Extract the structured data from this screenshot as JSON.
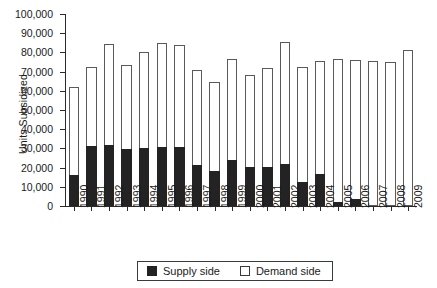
{
  "chart_data": {
    "type": "bar",
    "subtype": "stacked-column",
    "title": "",
    "xlabel": "",
    "ylabel": "Units Subsidized",
    "ylim": [
      0,
      100000
    ],
    "ytick_step": 10000,
    "ytick_labels": [
      "100,000",
      "90,000",
      "80,000",
      "70,000",
      "60,000",
      "50,000",
      "40,000",
      "30,000",
      "20,000",
      "10,000",
      "0"
    ],
    "ytick_values": [
      100000,
      90000,
      80000,
      70000,
      60000,
      50000,
      40000,
      30000,
      20000,
      10000,
      0
    ],
    "grid": false,
    "legend_position": "bottom-center",
    "categories": [
      "1990",
      "1991",
      "1992",
      "1993",
      "1994",
      "1995",
      "1996",
      "1997",
      "1998",
      "1999",
      "2000",
      "2001",
      "2002",
      "2003",
      "2004",
      "2005",
      "2006",
      "2007",
      "2008",
      "2009"
    ],
    "series": [
      {
        "name": "Supply side",
        "color": "#232323",
        "values": [
          16000,
          31500,
          32000,
          29500,
          30000,
          31000,
          30500,
          21500,
          18000,
          24000,
          20500,
          20500,
          22000,
          12500,
          16500,
          2000,
          3500,
          0,
          0,
          0
        ]
      },
      {
        "name": "Demand side",
        "color": "#ffffff",
        "values": [
          46000,
          41000,
          52500,
          44000,
          50000,
          54000,
          53500,
          49500,
          46500,
          52500,
          48000,
          51500,
          63500,
          60000,
          59000,
          74500,
          72500,
          75500,
          75000,
          81500
        ]
      }
    ],
    "totals": [
      62000,
      72500,
      84500,
      73500,
      80000,
      85000,
      84000,
      71000,
      64500,
      76500,
      68500,
      72000,
      85500,
      72500,
      75500,
      76500,
      76000,
      75500,
      75000,
      81500
    ],
    "annotations": []
  },
  "legend": {
    "items": [
      {
        "label": "Supply side",
        "swatch": "filled-square-black"
      },
      {
        "label": "Demand side",
        "swatch": "open-square-white"
      }
    ]
  }
}
